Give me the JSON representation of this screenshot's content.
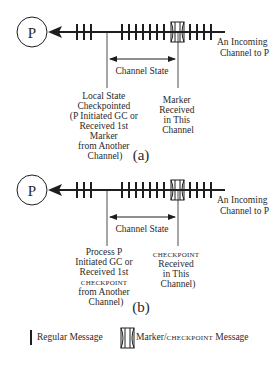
{
  "colors": {
    "stroke": "#1e1e1e",
    "text": "#2a2a2a",
    "background": "#ffffff"
  },
  "diagram_a": {
    "process_label": "P",
    "channel_label": [
      "An Incoming",
      "Channel to P"
    ],
    "channel_state_label": "Channel State",
    "left_event_label": [
      "Local State",
      "Checkpointed",
      "(P Initiated GC or",
      "Received 1st",
      "Marker",
      "from Another",
      "Channel)"
    ],
    "right_event_label": [
      "Marker",
      "Received",
      "in This",
      "Channel"
    ],
    "caption": "(a)",
    "left_ticks": 3,
    "middle_ticks": 7,
    "right_ticks": 4
  },
  "diagram_b": {
    "process_label": "P",
    "channel_label": [
      "An Incoming",
      "Channel to P"
    ],
    "channel_state_label": "Channel State",
    "left_event_label": [
      "Process P",
      "Initiated GC or",
      "Received 1st",
      "CHECKPOINT",
      "from Another",
      "Channel)"
    ],
    "right_event_label": [
      "CHECKPOINT",
      "Received",
      "in This",
      "Channel)"
    ],
    "caption": "(b)",
    "left_ticks": 3,
    "middle_ticks": 7,
    "right_ticks": 4
  },
  "legend": {
    "regular_label": "Regular Message",
    "marker_label_part1": "Marker/",
    "marker_label_part2": "CHECKPOINT",
    "marker_label_part3": " Message"
  }
}
